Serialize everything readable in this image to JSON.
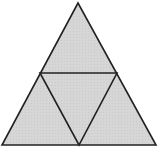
{
  "diagram": {
    "type": "subdivided-triangle",
    "fill_color": "#d4d4d4",
    "stroke_color": "#222222",
    "outer_triangle": {
      "apex": [
        78,
        3
      ],
      "base_left": [
        2,
        145
      ],
      "base_right": [
        156,
        145
      ]
    },
    "midpoints": {
      "left": [
        40,
        73
      ],
      "right": [
        117,
        73
      ],
      "bottom": [
        79,
        145
      ]
    },
    "sub_triangle_count": 4
  }
}
